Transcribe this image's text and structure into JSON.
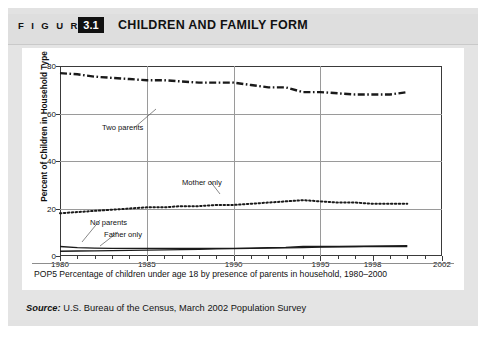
{
  "figure": {
    "label": "F I G U R E",
    "number": "3.1",
    "title": "CHILDREN AND FAMILY FORM"
  },
  "caption": "POP5 Percentage of children under age 18 by presence of parents in household, 1980–2000",
  "source": {
    "label": "Source:",
    "text": " U.S. Bureau of the Census, March 2002 Population Survey"
  },
  "colors": {
    "header_band": "#dedede",
    "page_background": "#e2e2e2",
    "card_background": "#ffffff",
    "axis": "#3a3a3a",
    "gridline": "#9a9a9a",
    "series": "#1a1a1a",
    "figure_number_box": "#111111"
  },
  "chart_data": {
    "type": "line",
    "title": "CHILDREN AND FAMILY FORM",
    "xlabel": "",
    "ylabel": "Percent of Children in Household Type",
    "xlim": [
      1980,
      2002
    ],
    "ylim": [
      0,
      80
    ],
    "yticks": [
      0,
      20,
      40,
      60,
      80
    ],
    "ytick_labels": [
      "0",
      "20",
      "40",
      "60",
      "80"
    ],
    "xticks": [
      1980,
      1985,
      1990,
      1995,
      1998,
      2002
    ],
    "xtick_labels": [
      "1980",
      "1985",
      "1990",
      "1995",
      "1998",
      "2002"
    ],
    "xticks_minor": [
      1981,
      1982,
      1983,
      1984,
      1986,
      1987,
      1988,
      1989,
      1991,
      1992,
      1993,
      1994,
      1996,
      1997,
      1999,
      2000,
      2001
    ],
    "grid": "both",
    "legend": "annotations-inline",
    "x": [
      1980,
      1981,
      1982,
      1983,
      1984,
      1985,
      1986,
      1987,
      1988,
      1989,
      1990,
      1991,
      1992,
      1993,
      1994,
      1995,
      1996,
      1997,
      1998,
      1999,
      2000
    ],
    "series": [
      {
        "name": "Two parents",
        "style": "dash-dot",
        "label_position": "upper-left",
        "values": [
          77,
          76.5,
          75.5,
          75,
          74.5,
          74,
          74,
          73.5,
          73,
          73,
          73,
          72,
          71,
          71,
          69,
          69,
          68.5,
          68,
          68,
          68,
          69
        ]
      },
      {
        "name": "Mother only",
        "style": "dotted",
        "label_position": "middle",
        "values": [
          18,
          18.5,
          19,
          19.5,
          20,
          20.5,
          20.5,
          21,
          21,
          21.5,
          21.5,
          22,
          22.5,
          23,
          23.5,
          23,
          22.5,
          22.5,
          22,
          22,
          22
        ]
      },
      {
        "name": "No parents",
        "style": "solid",
        "label_position": "lower-left",
        "values": [
          4,
          3.5,
          3.3,
          3.2,
          3.2,
          3.2,
          3.2,
          3.2,
          3.2,
          3.2,
          3.2,
          3.3,
          3.5,
          3.6,
          4,
          4,
          4,
          4,
          4,
          4,
          4
        ]
      },
      {
        "name": "Father only",
        "style": "solid",
        "label_position": "lower-left",
        "values": [
          2,
          2.1,
          2.2,
          2.3,
          2.4,
          2.5,
          2.6,
          2.7,
          2.8,
          3,
          3.1,
          3.2,
          3.3,
          3.4,
          3.5,
          3.7,
          3.9,
          4,
          4.2,
          4.3,
          4.4
        ]
      }
    ],
    "annotations": [
      {
        "text": "Two parents",
        "series": "Two parents"
      },
      {
        "text": "Mother only",
        "series": "Mother only"
      },
      {
        "text": "No parents",
        "series": "No parents"
      },
      {
        "text": "Father only",
        "series": "Father only"
      }
    ]
  }
}
